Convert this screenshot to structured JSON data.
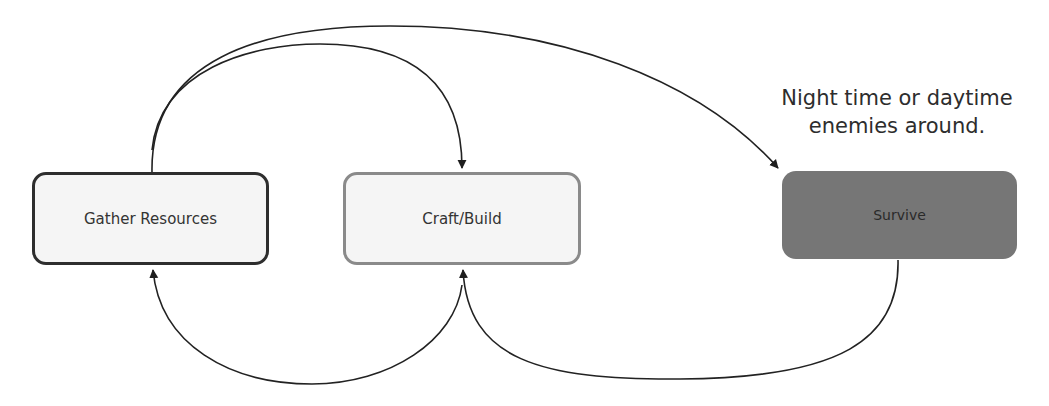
{
  "diagram": {
    "type": "flow-cycle",
    "nodes": [
      {
        "id": "gather",
        "label": "Gather Resources",
        "style": "light-fill-dark-border"
      },
      {
        "id": "craft",
        "label": "Craft/Build",
        "style": "light-fill-gray-border"
      },
      {
        "id": "survive",
        "label": "Survive",
        "style": "dark-gray-fill"
      }
    ],
    "annotation": {
      "line1": "Night time or daytime",
      "line2": "enemies around.",
      "attached_to": "survive"
    },
    "edges": [
      {
        "from": "gather",
        "to": "craft",
        "route": "over-top"
      },
      {
        "from": "gather",
        "to": "survive",
        "route": "over-top"
      },
      {
        "from": "craft",
        "to": "gather",
        "route": "under-bottom"
      },
      {
        "from": "survive",
        "to": "craft",
        "route": "under-bottom"
      }
    ],
    "colors": {
      "edge": "#222222",
      "gather_border": "#2e2e2e",
      "craft_border": "#8a8a8a",
      "survive_fill": "#767676",
      "node_fill": "#f5f5f5"
    }
  }
}
